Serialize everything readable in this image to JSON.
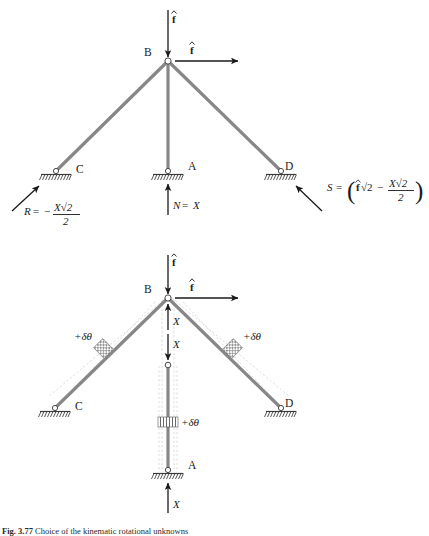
{
  "figure": {
    "caption_number": "Fig. 3.77",
    "caption_text": "Choice of the kinematic rotational unknowns"
  },
  "diagram_top": {
    "name": "force-equilibrium-diagram",
    "nodes": [
      {
        "id": "B",
        "label": "B",
        "type": "pin-joint"
      },
      {
        "id": "C",
        "label": "C",
        "type": "support"
      },
      {
        "id": "A",
        "label": "A",
        "type": "support"
      },
      {
        "id": "D",
        "label": "D",
        "type": "support"
      }
    ],
    "applied_loads": [
      {
        "name": "vertical-load-at-B",
        "label": "f",
        "accent": "hat",
        "direction": "down"
      },
      {
        "name": "horizontal-load-at-B",
        "label": "f",
        "accent": "hat",
        "direction": "right"
      }
    ],
    "reactions": [
      {
        "name": "reaction-R-at-C",
        "symbol": "R",
        "equals": "=",
        "sign": "−",
        "numerator": "X√2",
        "denominator": "2",
        "full_text": "R = − X√2 / 2"
      },
      {
        "name": "reaction-N-at-A",
        "symbol": "N",
        "equals": "=",
        "value": "X",
        "full_text": "N = X"
      },
      {
        "name": "reaction-S-at-D",
        "symbol": "S",
        "equals": "=",
        "term1": "f√2",
        "operator": "−",
        "numerator": "X√2",
        "denominator": "2",
        "full_text": "S = ( f√2 − X√2 / 2 )"
      }
    ]
  },
  "diagram_bottom": {
    "name": "virtual-rotation-diagram",
    "nodes": [
      {
        "id": "B",
        "label": "B",
        "type": "pin-joint"
      },
      {
        "id": "C",
        "label": "C",
        "type": "support"
      },
      {
        "id": "A",
        "label": "A",
        "type": "support"
      },
      {
        "id": "D",
        "label": "D",
        "type": "support"
      }
    ],
    "applied_loads": [
      {
        "name": "vertical-load-at-B",
        "label": "f",
        "accent": "hat",
        "direction": "down"
      },
      {
        "name": "horizontal-load-at-B",
        "label": "f",
        "accent": "hat",
        "direction": "right"
      }
    ],
    "internal_forces": [
      {
        "name": "internal-force-X-upper",
        "label": "X",
        "direction": "up"
      },
      {
        "name": "internal-force-X-lower",
        "label": "X",
        "direction": "down"
      },
      {
        "name": "internal-force-X-base",
        "label": "X",
        "direction": "up"
      }
    ],
    "hinges": [
      {
        "name": "hinge-left-member",
        "label": "+δθ"
      },
      {
        "name": "hinge-right-member",
        "label": "+δθ"
      },
      {
        "name": "hinge-middle-member",
        "label": "+δθ"
      }
    ]
  },
  "symbols": {
    "delta_theta": "+δθ",
    "sqrt2": "√2",
    "minus": "−",
    "X": "X"
  },
  "colors": {
    "member": "#878787",
    "ghost": "#b9b9b9",
    "ink": "#1a1a1a",
    "ground": "#3a3a3a",
    "background": "#ffffff"
  }
}
